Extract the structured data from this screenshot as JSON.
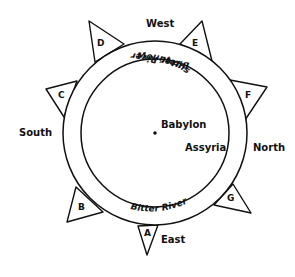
{
  "diagram": {
    "directions": {
      "west": "West",
      "east": "East",
      "south": "South",
      "north": "North"
    },
    "points": {
      "a": "A",
      "b": "B",
      "c": "C",
      "d": "D",
      "e": "E",
      "f": "F",
      "g": "G"
    },
    "places": {
      "center": "Babylon",
      "region": "Assyria"
    },
    "ring_labels": {
      "top_river": "Bitter River",
      "mountains": "Mountains",
      "bottom_river": "Bitter River"
    },
    "colors": {
      "ink": "#111111",
      "background": "#ffffff"
    }
  }
}
